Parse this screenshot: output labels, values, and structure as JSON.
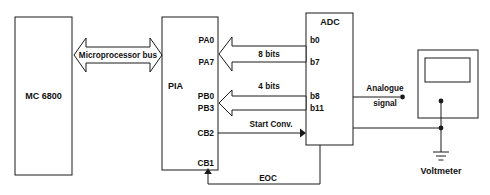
{
  "diagram": {
    "colors": {
      "line": "#1a1a1a",
      "background": "#ffffff",
      "text": "#111111"
    },
    "blocks": {
      "cpu": {
        "label": "MC 6800"
      },
      "pia": {
        "label": "PIA"
      },
      "adc": {
        "label": "ADC"
      },
      "voltmeter": {
        "label": "Voltmeter"
      }
    },
    "bus": {
      "label": "Microprocessor bus"
    },
    "pia_pins": {
      "pa0": "PA0",
      "pa7": "PA7",
      "pb0": "PB0",
      "pb3": "PB3",
      "cb2": "CB2",
      "cb1": "CB1"
    },
    "adc_pins": {
      "b0": "b0",
      "b7": "b7",
      "b8": "b8",
      "b11": "b11"
    },
    "signals": {
      "eight_bits": "8 bits",
      "four_bits": "4 bits",
      "start_conv": "Start Conv.",
      "eoc": "EOC",
      "analogue": "Analogue",
      "signal": "signal"
    }
  }
}
